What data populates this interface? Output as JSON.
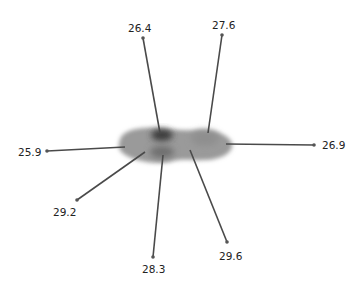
{
  "figure": {
    "type": "spider-blob-diagram",
    "center_blob": {
      "cx": 175,
      "cy": 145,
      "color": "#8a8a8a"
    },
    "spokes": [
      {
        "value": "26.4",
        "x1": 160,
        "y1": 133,
        "x2": 143,
        "y2": 38,
        "lx": 128,
        "ly": 22
      },
      {
        "value": "27.6",
        "x1": 208,
        "y1": 133,
        "x2": 222,
        "y2": 35,
        "lx": 212,
        "ly": 19
      },
      {
        "value": "26.9",
        "x1": 226,
        "y1": 144,
        "x2": 314,
        "y2": 145,
        "lx": 322,
        "ly": 139
      },
      {
        "value": "25.9",
        "x1": 125,
        "y1": 147,
        "x2": 47,
        "y2": 151,
        "lx": 18,
        "ly": 146
      },
      {
        "value": "29.2",
        "x1": 145,
        "y1": 152,
        "x2": 77,
        "y2": 200,
        "lx": 53,
        "ly": 206
      },
      {
        "value": "28.3",
        "x1": 163,
        "y1": 155,
        "x2": 153,
        "y2": 257,
        "lx": 142,
        "ly": 263
      },
      {
        "value": "29.6",
        "x1": 190,
        "y1": 150,
        "x2": 227,
        "y2": 242,
        "lx": 219,
        "ly": 250
      }
    ],
    "line_color": "#4a4a4a",
    "label_color": "#222222"
  }
}
